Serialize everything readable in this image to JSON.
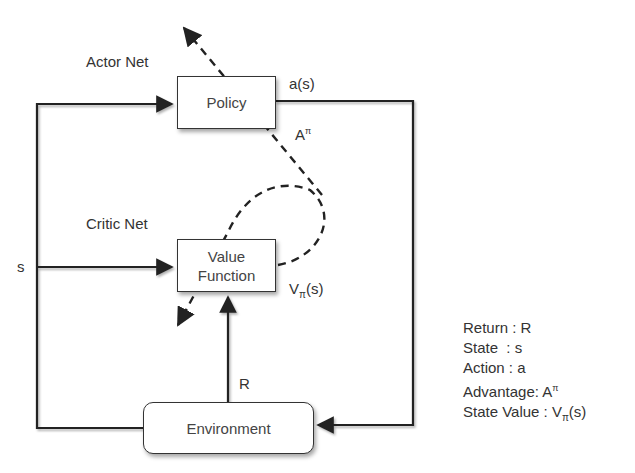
{
  "diagram": {
    "labels": {
      "actor_net": "Actor Net",
      "critic_net": "Critic Net",
      "action_output": "a(s)",
      "advantage_base": "A",
      "advantage_sup": "π",
      "state_input": "s",
      "value_base": "V",
      "value_sub": "π",
      "value_arg": "(s)",
      "reward": "R"
    },
    "nodes": {
      "policy": "Policy",
      "value_function_line1": "Value",
      "value_function_line2": "Function",
      "environment": "Environment"
    },
    "legend": [
      {
        "text": "Return : R"
      },
      {
        "text": "State  : s"
      },
      {
        "text": "Action : a"
      },
      {
        "text_base": "Advantage: A",
        "sup": "π"
      },
      {
        "text_base": "State Value : V",
        "sub": "π",
        "suffix": "(s)"
      }
    ]
  }
}
